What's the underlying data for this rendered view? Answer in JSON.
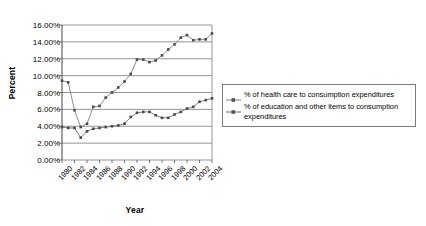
{
  "chart_data": {
    "type": "line",
    "title": "",
    "xlabel": "Year",
    "ylabel": "Percent",
    "grid": true,
    "legend_position": "right",
    "ylim": [
      0,
      16
    ],
    "ytick_labels": [
      "0.00%",
      "2.00%",
      "4.00%",
      "6.00%",
      "8.00%",
      "10.00%",
      "12.00%",
      "14.00%",
      "16.00%"
    ],
    "ytick_values": [
      0,
      2,
      4,
      6,
      8,
      10,
      12,
      14,
      16
    ],
    "xlim": [
      1980,
      2004
    ],
    "xtick_labels": [
      "1980",
      "1982",
      "1984",
      "1986",
      "1988",
      "1990",
      "1992",
      "1994",
      "1996",
      "1998",
      "2000",
      "2002",
      "2004"
    ],
    "xtick_values": [
      1980,
      1982,
      1984,
      1986,
      1988,
      1990,
      1992,
      1994,
      1996,
      1998,
      2000,
      2002,
      2004
    ],
    "x": [
      1980,
      1981,
      1982,
      1983,
      1984,
      1985,
      1986,
      1987,
      1988,
      1989,
      1990,
      1991,
      1992,
      1993,
      1994,
      1995,
      1996,
      1997,
      1998,
      1999,
      2000,
      2001,
      2002,
      2003,
      2004
    ],
    "series": [
      {
        "name": "% of health care to consumption expenditures",
        "color": "#808080",
        "values": [
          9.4,
          9.2,
          5.9,
          3.9,
          4.3,
          6.3,
          6.4,
          7.4,
          8.0,
          8.6,
          9.3,
          10.2,
          11.9,
          11.9,
          11.6,
          11.8,
          12.4,
          13.1,
          13.7,
          14.5,
          14.8,
          14.2,
          14.3,
          14.3,
          15.0
        ]
      },
      {
        "name": "% of education and other items to consumption expenditures",
        "color": "#707070",
        "values": [
          3.9,
          3.8,
          3.8,
          2.65,
          3.4,
          3.7,
          3.8,
          3.9,
          4.0,
          4.1,
          4.3,
          5.1,
          5.6,
          5.7,
          5.7,
          5.3,
          5.0,
          5.0,
          5.4,
          5.7,
          6.1,
          6.3,
          6.9,
          7.1,
          7.3
        ]
      }
    ],
    "legend_entries": [
      "% of health care to consumption expenditures",
      "% of education and other items to consumption expenditures"
    ]
  }
}
